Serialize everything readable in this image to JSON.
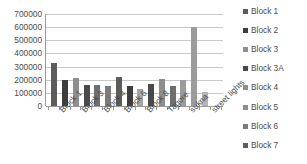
{
  "chart_data": {
    "type": "bar",
    "title": "",
    "xlabel": "",
    "ylabel": "",
    "ylim": [
      0,
      700000
    ],
    "ytick_step": 100000,
    "yticks": [
      "700000",
      "600000",
      "500000",
      "400000",
      "300000",
      "200000",
      "100000",
      "0"
    ],
    "grid": true,
    "legend_position": "right",
    "axis_label_rotation": -45,
    "categories": [
      "Block 1",
      "",
      "Block 3",
      "",
      "Block 4",
      "",
      "Block 6",
      "",
      "Block 8",
      "",
      "Tagore",
      "",
      "sukna",
      "",
      "street lights",
      ""
    ],
    "visible_tick_labels": [
      "Block 1",
      "Block 3",
      "Block 4",
      "Block 6",
      "Block 8",
      "Tagore",
      "sukna",
      "street lights"
    ],
    "values": [
      325000,
      195000,
      210000,
      160000,
      163000,
      152000,
      223000,
      150000,
      131000,
      170000,
      207000,
      152000,
      198000,
      605000,
      105000,
      0
    ],
    "bar_colors": [
      "#5c5c5c",
      "#3d3d3d",
      "#8e8e8e",
      "#4a4a4a",
      "#6e6e6e",
      "#7b7b7b",
      "#5c5c5c",
      "#3d3d3d",
      "#a5a5a5",
      "#4a4a4a",
      "#8e8e8e",
      "#6e6e6e",
      "#9b9b9b",
      "#9b9b9b",
      "#b5b5b5",
      "#c9c9c9"
    ],
    "axis_color": "#9a9a9a",
    "gridline_color": "#c8c8c8",
    "text_color": "#4a4a4a",
    "background": "#ffffff"
  },
  "legend": {
    "items": [
      {
        "label": "Block 1",
        "color": "#5c5c5c"
      },
      {
        "label": "Block 2",
        "color": "#3d3d3d"
      },
      {
        "label": "Block 3",
        "color": "#8e8e8e"
      },
      {
        "label": "Block 3A",
        "color": "#4a4a4a"
      },
      {
        "label": "Block 4",
        "color": "#8e8e8e"
      },
      {
        "label": "Block 5",
        "color": "#8e8e8e"
      },
      {
        "label": "Block 6",
        "color": "#7b7b7b"
      },
      {
        "label": "Block 7",
        "color": "#5c5c5c"
      }
    ]
  }
}
